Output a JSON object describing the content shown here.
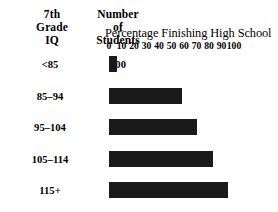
{
  "header": {
    "col_iq_lines": [
      "7th",
      "Grade",
      "IQ"
    ],
    "col_students_lines": [
      "Number",
      "of",
      "Students"
    ]
  },
  "chart_data": {
    "type": "bar",
    "orientation": "horizontal",
    "title": "Percentage Finishing High School",
    "xlabel": "Percentage Finishing High School",
    "ylabel": "7th Grade IQ",
    "xlim": [
      0,
      100
    ],
    "grid": false,
    "legend": null,
    "tick_labels": [
      "0",
      "10",
      "20",
      "30",
      "40",
      "50",
      "60",
      "70",
      "80",
      "90",
      "100"
    ],
    "tick_values": [
      0,
      10,
      20,
      30,
      40,
      50,
      60,
      70,
      80,
      90,
      100
    ],
    "categories": [
      "<85",
      "85–94",
      "95–104",
      "105–114",
      "115+"
    ],
    "values": [
      6,
      58,
      70,
      83,
      95
    ],
    "bar_color": "#1a1a1a",
    "extra_columns": [
      {
        "header": "Number of Students",
        "values": [
          "400",
          "575",
          "650",
          "575",
          "400"
        ]
      }
    ],
    "rows": [
      {
        "iq": "<85",
        "students": "400",
        "percent": 6
      },
      {
        "iq": "85–94",
        "students": "575",
        "percent": 58
      },
      {
        "iq": "95–104",
        "students": "650",
        "percent": 70
      },
      {
        "iq": "105–114",
        "students": "575",
        "percent": 83
      },
      {
        "iq": "115+",
        "students": "400",
        "percent": 95
      }
    ]
  }
}
